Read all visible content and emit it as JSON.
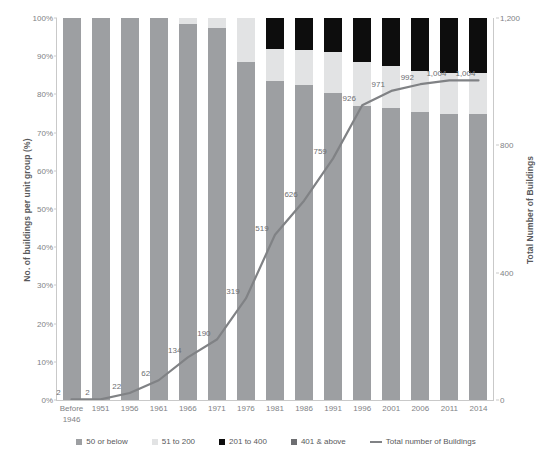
{
  "chart_data": {
    "type": "bar",
    "title": "",
    "xlabel": "",
    "ylabel": "No. of buildings per unit group (%)",
    "y2label": "Total Number of Buildings",
    "categories": [
      "Before 1946",
      "1951",
      "1956",
      "1961",
      "1966",
      "1971",
      "1976",
      "1981",
      "1986",
      "1991",
      "1996",
      "2001",
      "2006",
      "2011",
      "2014"
    ],
    "ylim": [
      0,
      100
    ],
    "y2lim": [
      0,
      1200
    ],
    "yticks": [
      "0%",
      "10%",
      "20%",
      "30%",
      "40%",
      "50%",
      "60%",
      "70%",
      "80%",
      "90%",
      "100%"
    ],
    "y2ticks": [
      "0",
      "400",
      "800",
      "1,200"
    ],
    "grid": false,
    "legend_position": "bottom",
    "series": [
      {
        "name": "50 or below",
        "color": "#9d9fa2",
        "values": [
          100,
          100,
          100,
          100,
          98.5,
          97.5,
          88.5,
          83.5,
          82.5,
          80.5,
          77.0,
          76.5,
          75.5,
          75.0,
          75.0
        ]
      },
      {
        "name": "51 to 200",
        "color": "#e2e3e4",
        "values": [
          0,
          0,
          0,
          0,
          1.5,
          2.5,
          11.5,
          8.5,
          9.0,
          10.5,
          11.5,
          11.0,
          10.5,
          10.5,
          10.5
        ]
      },
      {
        "name": "201 to 400",
        "color": "#0d0d0d",
        "values": [
          0,
          0,
          0,
          0,
          0,
          0,
          0,
          8.0,
          8.5,
          9.0,
          11.5,
          12.5,
          14.0,
          14.5,
          14.5
        ]
      },
      {
        "name": "401 & above",
        "color": "#6d6e71",
        "values": [
          0,
          0,
          0,
          0,
          0,
          0,
          0,
          0,
          0,
          0,
          0,
          0,
          0,
          0,
          0
        ]
      }
    ],
    "line": {
      "name": "Total number of Buildings",
      "color": "#808285",
      "axis": "y2",
      "values": [
        2,
        2,
        22,
        62,
        134,
        190,
        319,
        519,
        626,
        759,
        926,
        971,
        992,
        1004,
        1004
      ],
      "labels": [
        "2",
        "2",
        "22",
        "62",
        "134",
        "190",
        "319",
        "519",
        "626",
        "759",
        "926",
        "971",
        "992",
        "1,004",
        "1,004"
      ]
    }
  },
  "legend": {
    "items": [
      {
        "label": "50 or below",
        "swatch": "square-swatch-gray"
      },
      {
        "label": "51 to 200",
        "swatch": "square-swatch-light-gray"
      },
      {
        "label": "201 to 400",
        "swatch": "square-swatch-black"
      },
      {
        "label": "401 & above",
        "swatch": "square-swatch-dark-gray"
      },
      {
        "label": "Total number of Buildings",
        "swatch": "line-swatch"
      }
    ]
  }
}
